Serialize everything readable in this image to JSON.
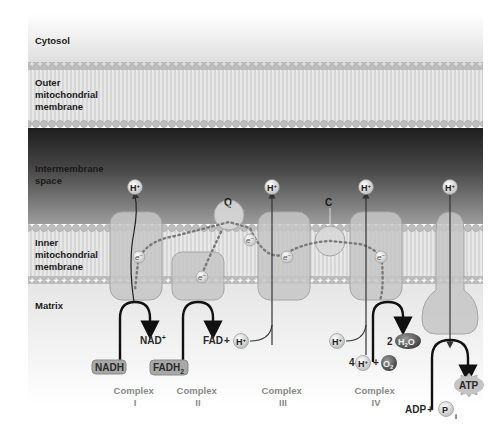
{
  "diagram": {
    "regions": {
      "cytosol": "Cytosol",
      "outer_membrane": [
        "Outer",
        "mitochondrial",
        "membrane"
      ],
      "intermembrane_space": [
        "Intermembrane",
        "space"
      ],
      "inner_membrane": [
        "Inner",
        "mitochondrial",
        "membrane"
      ],
      "matrix": "Matrix"
    },
    "carriers": {
      "q": "Q",
      "c": "C"
    },
    "complexes": [
      {
        "name": "Complex",
        "numeral": "I"
      },
      {
        "name": "Complex",
        "numeral": "II"
      },
      {
        "name": "Complex",
        "numeral": "III"
      },
      {
        "name": "Complex",
        "numeral": "IV"
      }
    ],
    "proton": "H",
    "proton_charge": "+",
    "electron": "e",
    "electron_charge": "−",
    "substrates": {
      "nadh": "NADH",
      "nad_plus": "NAD",
      "nad_plus_charge": "+",
      "fadh2": "FADH",
      "fadh2_sub": "2",
      "fad": "FAD",
      "plus": "+",
      "water_coef": "2",
      "water": "H",
      "water_sub": "2",
      "water_o": "O",
      "oxygen_coef": "4",
      "oxygen": "O",
      "oxygen_sub": "2",
      "adp": "ADP",
      "pi": "P",
      "pi_sub": "i",
      "atp": "ATP"
    },
    "colors": {
      "membrane_head": "#b9b9b9",
      "intermembrane_dark": "#2e2e2e",
      "protein": "#c9c9c9",
      "protein_stroke": "#a8a8a8",
      "complex_label": "#8a8a8a",
      "arrow": "#111111"
    }
  }
}
